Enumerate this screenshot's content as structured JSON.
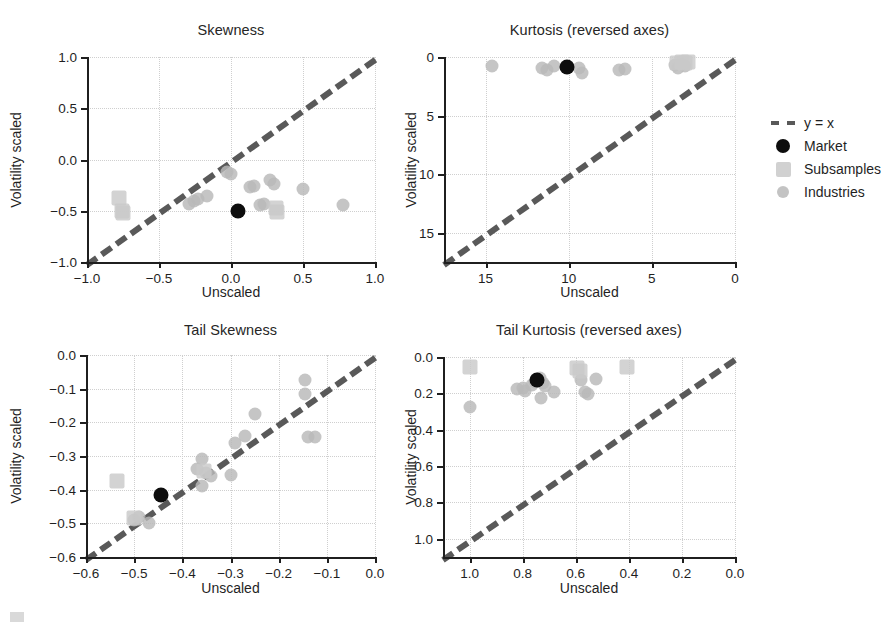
{
  "figure": {
    "width": 879,
    "height": 636,
    "background": "#ffffff",
    "colors": {
      "market": "#0d0d0d",
      "subsamples": "#c9c9c9",
      "industries": "#b8b8b8",
      "refline": "#595959",
      "grid": "#cfcfcf",
      "axis": "#1f1f1f"
    }
  },
  "legend": {
    "position": "right-middle",
    "entries": [
      {
        "marker": "dashed-line",
        "label": "y = x"
      },
      {
        "marker": "circle-black",
        "label": "Market"
      },
      {
        "marker": "square-gray",
        "label": "Subsamples"
      },
      {
        "marker": "circle-lightgray",
        "label": "Industries"
      }
    ]
  },
  "chart_data": [
    {
      "id": "skewness",
      "type": "scatter",
      "title": "Skewness",
      "xlabel": "Unscaled",
      "ylabel": "Volatility scaled",
      "xlim": [
        -1.0,
        1.0
      ],
      "ylim": [
        -1.0,
        1.0
      ],
      "xticks": [
        -1.0,
        -0.5,
        0.0,
        0.5,
        1.0
      ],
      "yticks": [
        -1.0,
        -0.5,
        0.0,
        0.5,
        1.0
      ],
      "xticklabels": [
        "-1.0",
        "-0.5",
        "0.0",
        "0.5",
        "1.0"
      ],
      "yticklabels": [
        "-1.0",
        "-0.5",
        "0.0",
        "0.5",
        "1.0"
      ],
      "reversed_axes": false,
      "grid": true,
      "refline": {
        "label": "y = x",
        "from": [
          -1.0,
          -1.0
        ],
        "to": [
          1.0,
          1.0
        ]
      },
      "series": [
        {
          "name": "Industries",
          "marker": "circle-lightgray",
          "points": [
            [
              -0.29,
              -0.43
            ],
            [
              -0.26,
              -0.4
            ],
            [
              -0.23,
              -0.39
            ],
            [
              -0.17,
              -0.36
            ],
            [
              -0.03,
              -0.12
            ],
            [
              0.0,
              -0.14
            ],
            [
              0.13,
              -0.27
            ],
            [
              0.16,
              -0.26
            ],
            [
              0.2,
              -0.44
            ],
            [
              0.23,
              -0.43
            ],
            [
              0.27,
              -0.2
            ],
            [
              0.3,
              -0.24
            ],
            [
              0.5,
              -0.29
            ],
            [
              0.78,
              -0.44
            ]
          ]
        },
        {
          "name": "Subsamples",
          "marker": "square-gray",
          "points": [
            [
              -0.78,
              -0.38
            ],
            [
              -0.76,
              -0.5
            ],
            [
              -0.75,
              -0.52
            ],
            [
              0.31,
              -0.47
            ],
            [
              0.32,
              -0.51
            ]
          ]
        },
        {
          "name": "Market",
          "marker": "circle-black",
          "points": [
            [
              0.05,
              -0.5
            ]
          ]
        }
      ]
    },
    {
      "id": "kurtosis",
      "type": "scatter",
      "title": "Kurtosis (reversed axes)",
      "xlabel": "Unscaled",
      "ylabel": "Volatility scaled",
      "xlim": [
        17.5,
        0.0
      ],
      "ylim": [
        17.5,
        0.0
      ],
      "xticks": [
        15,
        10,
        5,
        0
      ],
      "yticks": [
        0,
        5,
        10,
        15
      ],
      "xticklabels": [
        "15",
        "10",
        "5",
        "0"
      ],
      "yticklabels": [
        "0",
        "5",
        "10",
        "15"
      ],
      "reversed_axes": true,
      "grid": true,
      "refline": {
        "label": "y = x",
        "from": [
          17.5,
          17.5
        ],
        "to": [
          0.0,
          0.0
        ]
      },
      "series": [
        {
          "name": "Industries",
          "marker": "circle-lightgray",
          "points": [
            [
              14.6,
              0.75
            ],
            [
              11.6,
              0.9
            ],
            [
              11.3,
              1.1
            ],
            [
              10.9,
              0.8
            ],
            [
              9.4,
              0.9
            ],
            [
              9.2,
              1.4
            ],
            [
              7.0,
              1.1
            ],
            [
              6.6,
              1.0
            ],
            [
              3.6,
              0.7
            ],
            [
              3.4,
              0.9
            ],
            [
              3.2,
              0.6
            ],
            [
              3.0,
              0.8
            ]
          ]
        },
        {
          "name": "Subsamples",
          "marker": "square-gray",
          "points": [
            [
              3.5,
              0.5
            ],
            [
              3.2,
              0.4
            ],
            [
              3.0,
              0.5
            ],
            [
              2.8,
              0.4
            ]
          ]
        },
        {
          "name": "Market",
          "marker": "circle-black",
          "points": [
            [
              10.1,
              0.85
            ]
          ]
        }
      ]
    },
    {
      "id": "tail-skewness",
      "type": "scatter",
      "title": "Tail Skewness",
      "xlabel": "Unscaled",
      "ylabel": "Volatility scaled",
      "xlim": [
        -0.6,
        0.0
      ],
      "ylim": [
        -0.6,
        0.0
      ],
      "xticks": [
        -0.6,
        -0.5,
        -0.4,
        -0.3,
        -0.2,
        -0.1,
        0.0
      ],
      "yticks": [
        -0.6,
        -0.5,
        -0.4,
        -0.3,
        -0.2,
        -0.1,
        0.0
      ],
      "xticklabels": [
        "-0.6",
        "-0.5",
        "-0.4",
        "-0.3",
        "-0.2",
        "-0.1",
        "0.0"
      ],
      "yticklabels": [
        "-0.6",
        "-0.5",
        "-0.4",
        "-0.3",
        "-0.2",
        "-0.1",
        "0.0"
      ],
      "reversed_axes": false,
      "grid": true,
      "refline": {
        "label": "y = x",
        "from": [
          -0.6,
          -0.6
        ],
        "to": [
          0.0,
          0.0
        ]
      },
      "series": [
        {
          "name": "Industries",
          "marker": "circle-lightgray",
          "points": [
            [
              -0.5,
              -0.49
            ],
            [
              -0.49,
              -0.48
            ],
            [
              -0.47,
              -0.5
            ],
            [
              -0.37,
              -0.34
            ],
            [
              -0.36,
              -0.31
            ],
            [
              -0.36,
              -0.39
            ],
            [
              -0.35,
              -0.35
            ],
            [
              -0.34,
              -0.36
            ],
            [
              -0.3,
              -0.355
            ],
            [
              -0.29,
              -0.26
            ],
            [
              -0.27,
              -0.24
            ],
            [
              -0.25,
              -0.175
            ],
            [
              -0.14,
              -0.245
            ],
            [
              -0.125,
              -0.245
            ],
            [
              -0.145,
              -0.075
            ],
            [
              -0.145,
              -0.115
            ]
          ]
        },
        {
          "name": "Subsamples",
          "marker": "square-gray",
          "points": [
            [
              -0.535,
              -0.375
            ],
            [
              -0.5,
              -0.485
            ],
            [
              -0.355,
              -0.345
            ]
          ]
        },
        {
          "name": "Market",
          "marker": "circle-black",
          "points": [
            [
              -0.445,
              -0.415
            ]
          ]
        }
      ]
    },
    {
      "id": "tail-kurtosis",
      "type": "scatter",
      "title": "Tail Kurtosis (reversed axes)",
      "xlabel": "Unscaled",
      "ylabel": "Volatility scaled",
      "xlim": [
        1.1,
        0.0
      ],
      "ylim": [
        1.1,
        0.0
      ],
      "xticks": [
        1.0,
        0.8,
        0.6,
        0.4,
        0.2,
        0.0
      ],
      "yticks": [
        0.0,
        0.2,
        0.4,
        0.6,
        0.8,
        1.0
      ],
      "xticklabels": [
        "1.0",
        "0.8",
        "0.6",
        "0.4",
        "0.2",
        "0.0"
      ],
      "yticklabels": [
        "0.0",
        "0.2",
        "0.4",
        "0.6",
        "0.8",
        "1.0"
      ],
      "reversed_axes": true,
      "grid": true,
      "refline": {
        "label": "y = x",
        "from": [
          1.1,
          1.1
        ],
        "to": [
          0.0,
          0.0
        ]
      },
      "series": [
        {
          "name": "Industries",
          "marker": "circle-lightgray",
          "points": [
            [
              1.0,
              0.275
            ],
            [
              0.82,
              0.175
            ],
            [
              0.8,
              0.17
            ],
            [
              0.79,
              0.185
            ],
            [
              0.765,
              0.155
            ],
            [
              0.755,
              0.135
            ],
            [
              0.745,
              0.125
            ],
            [
              0.735,
              0.115
            ],
            [
              0.725,
              0.145
            ],
            [
              0.73,
              0.225
            ],
            [
              0.715,
              0.16
            ],
            [
              0.68,
              0.195
            ],
            [
              0.58,
              0.125
            ],
            [
              0.565,
              0.195
            ],
            [
              0.555,
              0.205
            ],
            [
              0.525,
              0.12
            ]
          ]
        },
        {
          "name": "Subsamples",
          "marker": "square-gray",
          "points": [
            [
              1.0,
              0.055
            ],
            [
              0.595,
              0.06
            ],
            [
              0.585,
              0.075
            ],
            [
              0.405,
              0.055
            ]
          ]
        },
        {
          "name": "Market",
          "marker": "circle-black",
          "points": [
            [
              0.745,
              0.125
            ]
          ]
        }
      ]
    }
  ]
}
